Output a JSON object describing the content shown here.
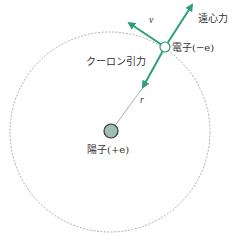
{
  "diagram": {
    "labels": {
      "centrifugal": "遠心力",
      "electron": "電子(−e)",
      "coulomb": "クーロン引力",
      "velocity": "v",
      "radius": "r",
      "proton": "陽子(+e)"
    },
    "colors": {
      "arrow": "#2e9e76",
      "proton_fill": "#9fbfb2",
      "orbit": "#999999",
      "text": "#333333"
    },
    "geometry": {
      "orbit_center": [
        110,
        132
      ],
      "orbit_radius": 100,
      "electron": [
        165,
        47
      ],
      "proton": [
        111,
        131
      ]
    }
  }
}
